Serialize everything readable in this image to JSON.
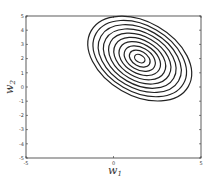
{
  "chart_data": {
    "type": "contour",
    "title": "",
    "xlabel": "w_1",
    "ylabel": "w_2",
    "xlim": [
      -5,
      5
    ],
    "ylim": [
      -5,
      5
    ],
    "x_ticks": [
      "-5",
      "0",
      "5"
    ],
    "y_ticks": [
      "5",
      "4",
      "3",
      "2",
      "1",
      "0",
      "-1",
      "-2",
      "-3",
      "-4",
      "-5"
    ],
    "grid": false,
    "legend": null,
    "contours": {
      "shape": "ellipse",
      "count": 10,
      "center": [
        1.5,
        2.0
      ],
      "rotation_deg": -30,
      "outer_semi_axes_data": [
        3.2,
        2.1
      ],
      "color": "#222222"
    }
  },
  "labels": {
    "x_main": "w",
    "x_sub": "1",
    "y_main": "w",
    "y_sub": "2"
  }
}
